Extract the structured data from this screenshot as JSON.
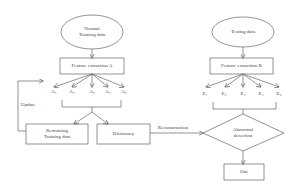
{
  "left_branch": {
    "input_ellipse": {
      "line1": "Normal",
      "line2": "Training data"
    },
    "feature_box": "Feature extraction A",
    "features": [
      "A₁",
      "A₂",
      "A₃",
      "A₄",
      "A₅"
    ],
    "remaining_box": {
      "line1": "Remaining",
      "line2": "Training data"
    },
    "dictionary_box": "Dictionary",
    "update_label": "Update"
  },
  "right_branch": {
    "input_ellipse": "Testing data",
    "feature_box": "Feature extraction B",
    "features": [
      "E₁",
      "E₂",
      "E₃",
      "E₄",
      "E₅"
    ],
    "reconstruction_label": "Reconstruction",
    "decision": {
      "line1": "Abnormal",
      "line2": "detection"
    },
    "output_box": "Out"
  },
  "colors": {
    "stroke": "#666666",
    "text": "#444444",
    "background": "#ffffff"
  }
}
